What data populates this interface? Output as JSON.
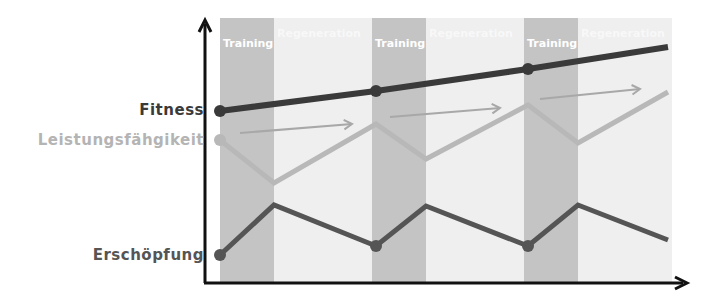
{
  "bands": [
    {
      "label": "Training",
      "type": "training",
      "x0": 220,
      "x1": 274
    },
    {
      "label": "Regeneration",
      "type": "regeneration",
      "x0": 274,
      "x1": 372
    },
    {
      "label": "Training",
      "type": "training",
      "x0": 372,
      "x1": 426
    },
    {
      "label": "Regeneration",
      "type": "regeneration",
      "x0": 426,
      "x1": 524
    },
    {
      "label": "Training",
      "type": "training",
      "x0": 524,
      "x1": 578
    },
    {
      "label": "Regeneration",
      "type": "regeneration",
      "x0": 578,
      "x1": 672
    }
  ],
  "labels": {
    "fitness": "Fitness",
    "performance": "Leistungsfähgikeit",
    "fatigue": "Erschöpfung"
  },
  "colors": {
    "training_band": "#c4c4c4",
    "regeneration_band": "#efefef",
    "fitness_line": "#3a3a3a",
    "fitness_label": "#3a3a3a",
    "performance_line": "#b8b8b8",
    "performance_label": "#b4b4b4",
    "fatigue_line": "#555555",
    "fatigue_label": "#555555",
    "axis": "#111111"
  },
  "chart_data": {
    "type": "line",
    "title": "",
    "xlabel": "",
    "ylabel": "",
    "phases": [
      "Training",
      "Regeneration",
      "Training",
      "Regeneration",
      "Training",
      "Regeneration"
    ],
    "series": [
      {
        "name": "Fitness",
        "points": [
          [
            220,
            111
          ],
          [
            376,
            91
          ],
          [
            528,
            69
          ],
          [
            668,
            47
          ]
        ],
        "markers": [
          0,
          1,
          2
        ]
      },
      {
        "name": "Leistungsfähgikeit",
        "points": [
          [
            220,
            140
          ],
          [
            274,
            183
          ],
          [
            376,
            124
          ],
          [
            426,
            159
          ],
          [
            528,
            105
          ],
          [
            578,
            143
          ],
          [
            668,
            92
          ]
        ],
        "markers": [
          0
        ]
      },
      {
        "name": "Erschöpfung",
        "points": [
          [
            220,
            255
          ],
          [
            274,
            205
          ],
          [
            376,
            246
          ],
          [
            426,
            206
          ],
          [
            528,
            246
          ],
          [
            578,
            205
          ],
          [
            668,
            240
          ]
        ],
        "markers": [
          0,
          2,
          4
        ]
      }
    ],
    "trend_arrows": [
      {
        "from": [
          240,
          133
        ],
        "to": [
          352,
          124
        ]
      },
      {
        "from": [
          390,
          117
        ],
        "to": [
          500,
          108
        ]
      },
      {
        "from": [
          540,
          99
        ],
        "to": [
          640,
          89
        ]
      }
    ]
  }
}
